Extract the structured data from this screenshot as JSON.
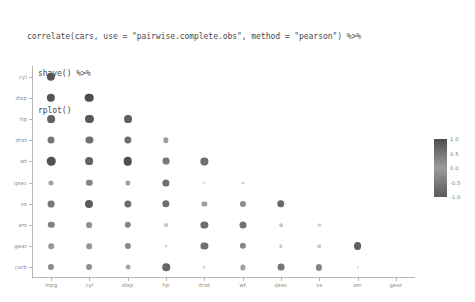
{
  "code": {
    "lines": [
      {
        "text": "correlate(cars, use = \"pairwise.complete.obs\", method = \"pearson\") %>%",
        "indented": false
      },
      {
        "text": "shave() %>%",
        "indented": true
      },
      {
        "text": "rplot()",
        "indented": true
      }
    ]
  },
  "legend": {
    "title": "",
    "ticks": [
      "1.0",
      "0.5",
      "0.0",
      "-0.5",
      "-1.0"
    ],
    "tick_values": [
      1.0,
      0.5,
      0.0,
      -0.5,
      -1.0
    ],
    "gradient_high_color": "#4d4d4d",
    "gradient_mid_color": "#9b9b9b",
    "gradient_low_color": "#5a5a5a"
  },
  "chart_data": {
    "type": "heatmap",
    "subtype": "correlation-dot-matrix",
    "title": "",
    "xlabel": "",
    "ylabel": "",
    "grid": false,
    "legend_position": "right",
    "zlim": [
      -1.0,
      1.0
    ],
    "x": [
      "mpg",
      "cyl",
      "disp",
      "hp",
      "drat",
      "wt",
      "qsec",
      "vs",
      "am",
      "gear"
    ],
    "y": [
      "cyl",
      "disp",
      "hp",
      "drat",
      "wt",
      "qsec",
      "vs",
      "am",
      "gear",
      "carb"
    ],
    "note": "Lower-triangular (shaved) Pearson correlation matrix of the mtcars dataset. Dot area and darkness encode absolute correlation magnitude.",
    "cells": [
      {
        "row": "cyl",
        "col": "mpg",
        "value": -0.85
      },
      {
        "row": "disp",
        "col": "mpg",
        "value": -0.85
      },
      {
        "row": "disp",
        "col": "cyl",
        "value": 0.9
      },
      {
        "row": "hp",
        "col": "mpg",
        "value": -0.78
      },
      {
        "row": "hp",
        "col": "cyl",
        "value": 0.83
      },
      {
        "row": "hp",
        "col": "disp",
        "value": 0.79
      },
      {
        "row": "drat",
        "col": "mpg",
        "value": 0.68
      },
      {
        "row": "drat",
        "col": "cyl",
        "value": -0.7
      },
      {
        "row": "drat",
        "col": "disp",
        "value": -0.71
      },
      {
        "row": "drat",
        "col": "hp",
        "value": -0.45
      },
      {
        "row": "wt",
        "col": "mpg",
        "value": -0.87
      },
      {
        "row": "wt",
        "col": "cyl",
        "value": 0.78
      },
      {
        "row": "wt",
        "col": "disp",
        "value": 0.89
      },
      {
        "row": "wt",
        "col": "hp",
        "value": 0.66
      },
      {
        "row": "wt",
        "col": "drat",
        "value": -0.71
      },
      {
        "row": "qsec",
        "col": "mpg",
        "value": 0.42
      },
      {
        "row": "qsec",
        "col": "cyl",
        "value": -0.59
      },
      {
        "row": "qsec",
        "col": "disp",
        "value": -0.43
      },
      {
        "row": "qsec",
        "col": "hp",
        "value": -0.71
      },
      {
        "row": "qsec",
        "col": "drat",
        "value": 0.09
      },
      {
        "row": "qsec",
        "col": "wt",
        "value": -0.17
      },
      {
        "row": "vs",
        "col": "mpg",
        "value": 0.66
      },
      {
        "row": "vs",
        "col": "cyl",
        "value": -0.81
      },
      {
        "row": "vs",
        "col": "disp",
        "value": -0.71
      },
      {
        "row": "vs",
        "col": "hp",
        "value": -0.72
      },
      {
        "row": "vs",
        "col": "drat",
        "value": 0.44
      },
      {
        "row": "vs",
        "col": "wt",
        "value": -0.55
      },
      {
        "row": "vs",
        "col": "qsec",
        "value": 0.74
      },
      {
        "row": "am",
        "col": "mpg",
        "value": 0.6
      },
      {
        "row": "am",
        "col": "cyl",
        "value": -0.52
      },
      {
        "row": "am",
        "col": "disp",
        "value": -0.59
      },
      {
        "row": "am",
        "col": "hp",
        "value": -0.24
      },
      {
        "row": "am",
        "col": "drat",
        "value": 0.71
      },
      {
        "row": "am",
        "col": "wt",
        "value": -0.69
      },
      {
        "row": "am",
        "col": "qsec",
        "value": -0.23
      },
      {
        "row": "am",
        "col": "vs",
        "value": 0.17
      },
      {
        "row": "gear",
        "col": "mpg",
        "value": 0.48
      },
      {
        "row": "gear",
        "col": "cyl",
        "value": -0.49
      },
      {
        "row": "gear",
        "col": "disp",
        "value": -0.56
      },
      {
        "row": "gear",
        "col": "hp",
        "value": -0.13
      },
      {
        "row": "gear",
        "col": "drat",
        "value": 0.7
      },
      {
        "row": "gear",
        "col": "wt",
        "value": -0.58
      },
      {
        "row": "gear",
        "col": "qsec",
        "value": -0.21
      },
      {
        "row": "gear",
        "col": "vs",
        "value": 0.21
      },
      {
        "row": "gear",
        "col": "am",
        "value": 0.79
      },
      {
        "row": "carb",
        "col": "mpg",
        "value": -0.55
      },
      {
        "row": "carb",
        "col": "cyl",
        "value": 0.53
      },
      {
        "row": "carb",
        "col": "disp",
        "value": 0.39
      },
      {
        "row": "carb",
        "col": "hp",
        "value": 0.75
      },
      {
        "row": "carb",
        "col": "drat",
        "value": -0.09
      },
      {
        "row": "carb",
        "col": "wt",
        "value": 0.43
      },
      {
        "row": "carb",
        "col": "qsec",
        "value": -0.66
      },
      {
        "row": "carb",
        "col": "vs",
        "value": -0.57
      },
      {
        "row": "carb",
        "col": "am",
        "value": 0.06
      }
    ]
  }
}
